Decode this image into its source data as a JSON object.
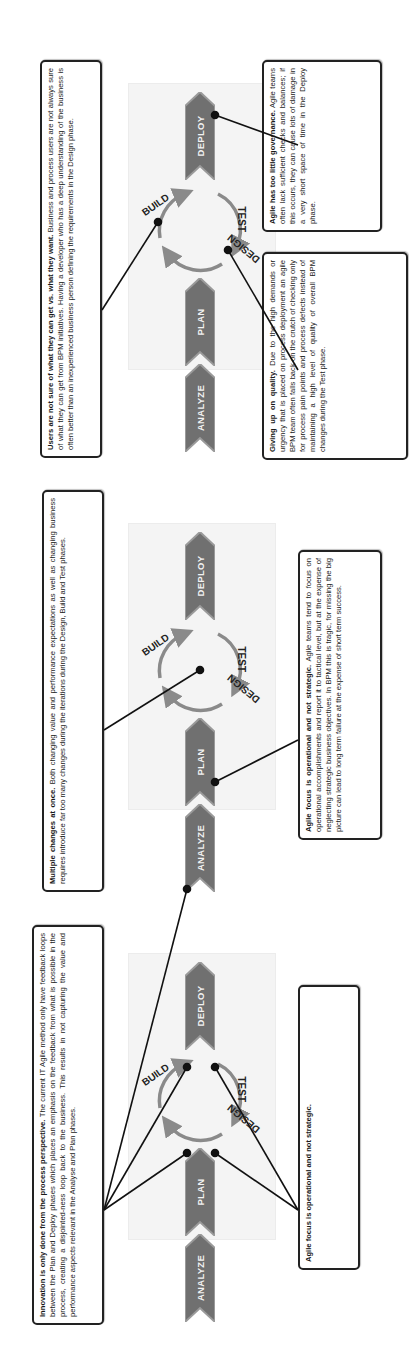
{
  "orientation": "rotated 90 degrees counter-clockwise",
  "phases": {
    "analyze": "ANALYZE",
    "plan": "PLAN",
    "deploy": "DEPLOY"
  },
  "cycle": {
    "design": "DESIGN",
    "build": "BUILD",
    "test": "TEST"
  },
  "colors": {
    "chevron_fill": "#707070",
    "chevron_border": "#9a9a9a",
    "cycle_arrow": "#8a8a8a",
    "connector": "#111111",
    "panel_bg": "#f4f4f4"
  },
  "panels": [
    {
      "top_note": {
        "title": "Innovation is only done from the process perspective.",
        "body": " The current IT Agile method only have feedback loops between the Plan and Deploy phases which places an emphasis on the feedback from what is possible in the process, creating a disjointed-ness loop back to the business. This results in not capturing the value and performance aspects relevant in the Analyse and Plan phases."
      },
      "bottom_note": {
        "title": "Limited executive sponsorship equals limited agility.",
        "body": " Agility requires sponsorship at the highest level. It requires dedicated top performers and empowering them to challenge the status quo during the Analyze and Plan phases."
      }
    },
    {
      "top_note": {
        "title": "Multiple changes at once.",
        "body": " Both changing value and performance expectations as well as changing business requires introduce far too many changes during the iterations during the Design, Build and Test phases."
      },
      "bottom_note": {
        "title": "Agile focus is operational and not strategic.",
        "body": " Agile teams tend to focus on operational accomplishments and report it to tactical level, but at the expense of neglecting strategic business objectives. In BPM this is tragic, for missing the big picture can lead to long term failure at the expense of short term success."
      }
    },
    {
      "top_note": {
        "title": "Users are not sure of what they can get vs. what they want.",
        "body": " Business and process users are not always sure of what they can get from BPM initiatives. Having a developer who has a deep understanding of the business is often better than an inexperienced business person defining the requirements in the Design phase."
      },
      "bottom_note_left": {
        "title": "Giving up on quality.",
        "body": " Due to the high demands or urgency that is placed on process deployment an agile BPM team often falls back on the crutch of checking only for process pain points and process defects instead of maintaining a high level of quality of overall BPM changes during the Test phase."
      },
      "bottom_note_right": {
        "title": "Agile has too little governance.",
        "body": " Agile teams often lack sufficient checks and balances; if this occurs, they can cause lots of damage in a very short space of time in the Deploy phase."
      }
    }
  ]
}
